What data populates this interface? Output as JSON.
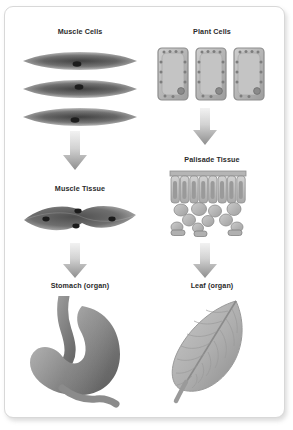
{
  "diagram": {
    "background_color": "#ffffff",
    "card_border_color": "#d8d8d8",
    "label_color": "#2b2b2b",
    "arrow_color_light": "#e4e4e4",
    "arrow_color_dark": "#8f8f8f",
    "columns": [
      {
        "id": "animal",
        "levels": [
          {
            "level": "cell",
            "label": "Muscle Cells",
            "icon": "muscle-cells-icon"
          },
          {
            "level": "tissue",
            "label": "Muscle Tissue",
            "icon": "muscle-tissue-icon"
          },
          {
            "level": "organ",
            "label": "Stomach (organ)",
            "icon": "stomach-icon"
          }
        ],
        "arrows": [
          {
            "name": "arrow-muscle-cells-to-muscle-tissue"
          },
          {
            "name": "arrow-muscle-tissue-to-stomach"
          }
        ]
      },
      {
        "id": "plant",
        "levels": [
          {
            "level": "cell",
            "label": "Plant Cells",
            "icon": "plant-cells-icon"
          },
          {
            "level": "tissue",
            "label": "Palisade Tissue",
            "icon": "palisade-tissue-icon"
          },
          {
            "level": "organ",
            "label": "Leaf (organ)",
            "icon": "leaf-icon"
          }
        ],
        "arrows": [
          {
            "name": "arrow-plant-cells-to-palisade-tissue"
          },
          {
            "name": "arrow-palisade-tissue-to-leaf"
          }
        ]
      }
    ]
  },
  "labels": {
    "muscle_cells": "Muscle Cells",
    "plant_cells": "Plant Cells",
    "muscle_tissue": "Muscle Tissue",
    "palisade_tissue": "Palisade Tissue",
    "stomach_organ": "Stomach (organ)",
    "leaf_organ": "Leaf (organ)"
  }
}
